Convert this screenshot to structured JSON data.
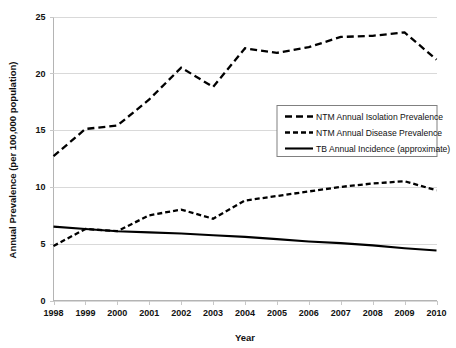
{
  "chart_data": {
    "type": "line",
    "title": "",
    "xlabel": "Year",
    "ylabel": "Annual Prevalence (per 100,000 population)",
    "categories": [
      "1998",
      "1999",
      "2000",
      "2001",
      "2002",
      "2003",
      "2004",
      "2005",
      "2006",
      "2007",
      "2008",
      "2009",
      "2010"
    ],
    "x": [
      1998,
      1999,
      2000,
      2001,
      2002,
      2003,
      2004,
      2005,
      2006,
      2007,
      2008,
      2009,
      2010
    ],
    "xlim": [
      1998,
      2010
    ],
    "ylim": [
      0,
      25
    ],
    "yticks": [
      0,
      5,
      10,
      15,
      20,
      25
    ],
    "ytick_labels": [
      "0",
      "5",
      "10",
      "15",
      "20",
      "25"
    ],
    "grid": true,
    "legend_position": "center-right",
    "series": [
      {
        "name": "NTM Annual Isolation Prevalence",
        "style": "long-dash",
        "color": "#000000",
        "values": [
          12.7,
          15.1,
          15.4,
          17.7,
          20.5,
          18.8,
          22.2,
          21.8,
          22.3,
          23.2,
          23.3,
          23.6,
          21.2
        ]
      },
      {
        "name": "NTM Annual Disease Prevalence",
        "style": "short-dash",
        "color": "#000000",
        "values": [
          4.8,
          6.3,
          6.1,
          7.5,
          8.0,
          7.2,
          8.8,
          9.2,
          9.6,
          10.0,
          10.3,
          10.5,
          9.7
        ]
      },
      {
        "name": "TB Annual Incidence (approximate)",
        "style": "solid",
        "color": "#000000",
        "values": [
          6.5,
          6.3,
          6.1,
          6.0,
          5.9,
          5.75,
          5.6,
          5.4,
          5.2,
          5.05,
          4.85,
          4.6,
          4.4
        ]
      }
    ]
  },
  "axes": {
    "y_axis_title": "Annual Prevalence (per 100,000 population)",
    "x_axis_title": "Year"
  },
  "legend": {
    "items": [
      {
        "label": "NTM Annual Isolation Prevalence",
        "style": "long-dash"
      },
      {
        "label": "NTM Annual Disease Prevalence",
        "style": "short-dash"
      },
      {
        "label": "TB Annual Incidence (approximate)",
        "style": "solid"
      }
    ]
  },
  "colors": {
    "ink": "#000000",
    "grid": "#d9d9d9",
    "axis": "#b4b4b4",
    "legend_border": "#808080",
    "background": "#ffffff"
  }
}
